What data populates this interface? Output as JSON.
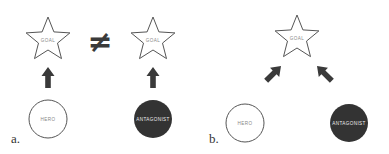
{
  "colors": {
    "outline": "#555555",
    "arrow": "#3a3a3a",
    "antagonist_fill": "#333333",
    "label_light": "#888888",
    "label_dark": "#eeeeee"
  },
  "panel_a": {
    "label": "a.",
    "left_goal": {
      "label": "GOAL",
      "icon": "star-icon"
    },
    "not_equal_symbol": "≠",
    "right_goal": {
      "label": "GOAL",
      "icon": "star-icon"
    },
    "hero": {
      "label": "HERO"
    },
    "antagonist": {
      "label": "ANTAGONIST"
    },
    "arrows": [
      "hero-to-goal (up)",
      "antagonist-to-goal (up)"
    ]
  },
  "panel_b": {
    "label": "b.",
    "goal": {
      "label": "GOAL",
      "icon": "star-icon"
    },
    "hero": {
      "label": "HERO"
    },
    "antagonist": {
      "label": "ANTAGONIST"
    },
    "arrows": [
      "hero-to-goal (diagonal up-right)",
      "antagonist-to-goal (diagonal up-left)"
    ]
  }
}
